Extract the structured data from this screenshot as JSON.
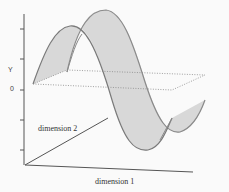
{
  "diagram": {
    "title": "",
    "axes": {
      "y_label": "Y",
      "zero_label": "0",
      "dim1_label": "dimension 1",
      "dim2_label": "dimension 2"
    },
    "colors": {
      "ribbon_fill": "#d6d6d6",
      "ribbon_edge": "#808080",
      "axis": "#555555",
      "zero_plane": "#888888",
      "background": "#fafafa"
    }
  }
}
